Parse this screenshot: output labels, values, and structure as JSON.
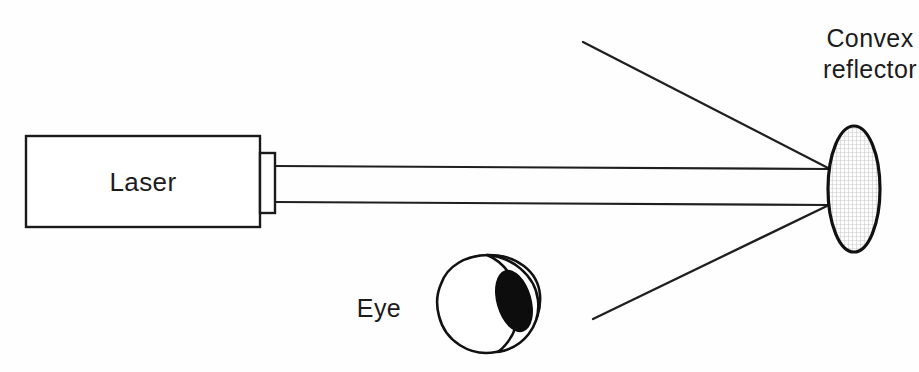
{
  "figure": {
    "background_color": "#fefefe",
    "ink_color": "#1a1a1a",
    "width": 919,
    "height": 372
  },
  "labels": {
    "laser": "Laser",
    "eye": "Eye",
    "reflector_line1": "Convex",
    "reflector_line2": "reflector"
  },
  "components": {
    "laser_box": {
      "name": "laser",
      "x": 26,
      "y": 136,
      "width": 234,
      "height": 91,
      "fill": "#ffffff",
      "stroke": "#1a1a1a"
    },
    "laser_aperture": {
      "name": "aperture",
      "x": 260,
      "y": 153,
      "width": 15,
      "height": 60,
      "fill": "#ffffff",
      "stroke": "#1a1a1a"
    },
    "reflector": {
      "name": "convex-reflector",
      "center_x": 854,
      "center_y": 189,
      "radius_x": 26,
      "radius_y": 63,
      "fill_pattern": "fine-grid-hatch",
      "fill_color": "#d9d9d9",
      "stroke": "#111111"
    },
    "eye": {
      "name": "eye",
      "center_x": 487,
      "center_y": 307,
      "iris_center_x": 516,
      "iris_center_y": 302,
      "iris_radius_x": 19,
      "iris_radius_y": 33,
      "iris_rotation_deg": -18,
      "pupil_color": "#0d0d0d",
      "sclera_color": "#ffffff",
      "stroke": "#111111"
    }
  },
  "beams": {
    "incident_upper": {
      "x1": 275,
      "y1": 166,
      "x2": 830,
      "y2": 169
    },
    "incident_lower": {
      "x1": 275,
      "y1": 202,
      "x2": 829,
      "y2": 205
    },
    "reflected_upper": {
      "x1": 830,
      "y1": 169,
      "x2": 583,
      "y2": 42
    },
    "reflected_lower": {
      "x1": 829,
      "y1": 205,
      "x2": 593,
      "y2": 319
    }
  },
  "label_positions": {
    "laser": {
      "x": 143,
      "y": 191
    },
    "eye": {
      "x": 379,
      "y": 317
    },
    "reflector": {
      "x": 870,
      "y": 47,
      "line_height": 31
    }
  }
}
